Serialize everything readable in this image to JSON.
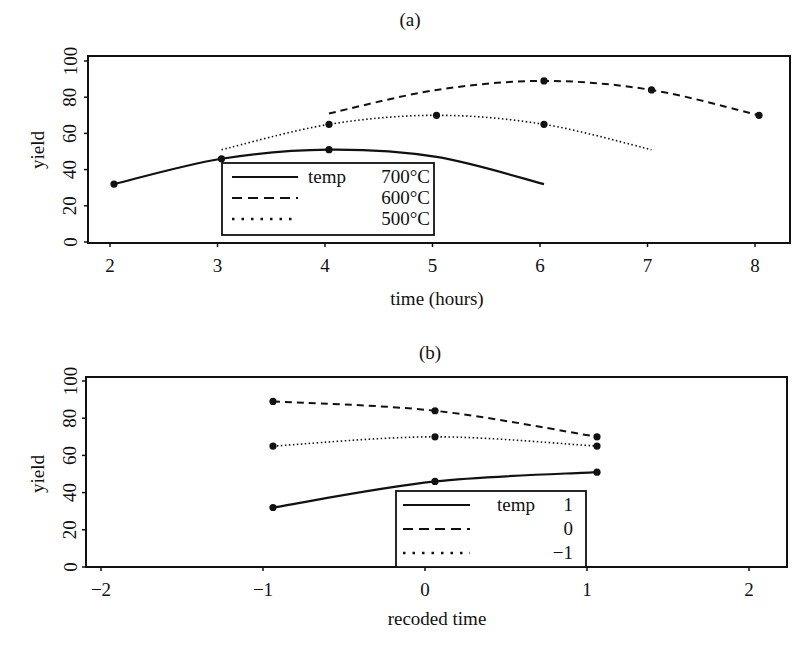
{
  "chart_data": [
    {
      "id": "a",
      "type": "line",
      "title": "(a)",
      "xlabel": "time (hours)",
      "ylabel": "yield",
      "xlim": [
        1.9,
        8.3
      ],
      "ylim": [
        0,
        100
      ],
      "xticks": [
        "2",
        "3",
        "4",
        "5",
        "6",
        "7",
        "8"
      ],
      "yticks": [
        "0",
        "20",
        "40",
        "60",
        "80",
        "100"
      ],
      "grid": false,
      "legend": {
        "title": "temp",
        "position": "lower-center",
        "entries": [
          "700°C",
          "600°C",
          "500°C"
        ]
      },
      "series": [
        {
          "name": "700°C",
          "style": "solid",
          "points": [
            [
              2,
              32
            ],
            [
              3,
              46
            ],
            [
              4,
              51
            ]
          ],
          "curve": [
            [
              2,
              32
            ],
            [
              3,
              46
            ],
            [
              4,
              51
            ],
            [
              5,
              47
            ],
            [
              6,
              32
            ]
          ]
        },
        {
          "name": "600°C",
          "style": "dashed",
          "points": [
            [
              6,
              89
            ],
            [
              7,
              84
            ],
            [
              8,
              70
            ]
          ],
          "curve": [
            [
              4,
              71
            ],
            [
              5,
              84
            ],
            [
              6,
              89
            ],
            [
              7,
              84
            ],
            [
              8,
              70
            ]
          ]
        },
        {
          "name": "500°C",
          "style": "dotted",
          "points": [
            [
              4,
              65
            ],
            [
              5,
              70
            ],
            [
              6,
              65
            ]
          ],
          "curve": [
            [
              3,
              51
            ],
            [
              4,
              65
            ],
            [
              5,
              70
            ],
            [
              6,
              65
            ],
            [
              7,
              51
            ]
          ]
        }
      ]
    },
    {
      "id": "b",
      "type": "line",
      "title": "(b)",
      "xlabel": "recoded time",
      "ylabel": "yield",
      "xlim": [
        -2.1,
        2.3
      ],
      "ylim": [
        0,
        100
      ],
      "xticks": [
        "−2",
        "−1",
        "0",
        "1",
        "2"
      ],
      "yticks": [
        "0",
        "20",
        "40",
        "60",
        "80",
        "100"
      ],
      "grid": false,
      "legend": {
        "title": "temp",
        "position": "lower-center",
        "entries": [
          "1",
          "0",
          "−1"
        ]
      },
      "series": [
        {
          "name": "1",
          "style": "solid",
          "points": [
            [
              -1,
              32
            ],
            [
              0,
              46
            ],
            [
              1,
              51
            ]
          ]
        },
        {
          "name": "0",
          "style": "dashed",
          "points": [
            [
              -1,
              89
            ],
            [
              0,
              84
            ],
            [
              1,
              70
            ]
          ]
        },
        {
          "name": "−1",
          "style": "dotted",
          "points": [
            [
              -1,
              65
            ],
            [
              0,
              70
            ],
            [
              1,
              65
            ]
          ]
        }
      ]
    }
  ]
}
